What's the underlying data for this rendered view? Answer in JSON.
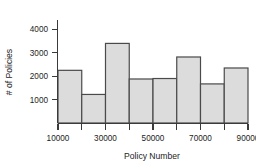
{
  "chart_data": {
    "type": "bar",
    "title": "",
    "subtitle": "",
    "xlabel": "Policy Number",
    "ylabel": "# of Policies",
    "categories": [
      "10000-20000",
      "20000-30000",
      "30000-40000",
      "40000-50000",
      "50000-60000",
      "60000-70000",
      "70000-80000",
      "80000-90000"
    ],
    "bin_edges": [
      10000,
      20000,
      30000,
      40000,
      50000,
      60000,
      70000,
      80000,
      90000
    ],
    "values": [
      2250,
      1220,
      3400,
      1880,
      1900,
      2820,
      1670,
      2350
    ],
    "series": [
      {
        "name": "# of Policies",
        "values": [
          2250,
          1220,
          3400,
          1880,
          1900,
          2820,
          1670,
          2350
        ]
      }
    ],
    "xlim": [
      10000,
      90000
    ],
    "ylim": [
      0,
      4400
    ],
    "x_ticks": [
      10000,
      20000,
      30000,
      40000,
      50000,
      60000,
      70000,
      80000,
      90000
    ],
    "x_tick_labels": [
      "10000",
      "",
      "30000",
      "",
      "50000",
      "",
      "70000",
      "",
      "90000"
    ],
    "y_ticks": [
      1000,
      2000,
      3000,
      4000
    ],
    "y_tick_labels": [
      "1000",
      "2000",
      "3000",
      "4000"
    ],
    "grid": false,
    "legend": false,
    "legend_position": "none",
    "bar_fill_color": "#dcdcdc",
    "bar_edge_color": "#4a4a4a",
    "axis_color": "#3a3a3a",
    "background_color": "#ffffff"
  },
  "labels": {
    "x_axis_title": "Policy Number",
    "y_axis_title": "# of Policies",
    "x_tick_0": "10000",
    "x_tick_1": "30000",
    "x_tick_2": "50000",
    "x_tick_3": "70000",
    "x_tick_4": "90000",
    "y_tick_0": "1000",
    "y_tick_1": "2000",
    "y_tick_2": "3000",
    "y_tick_3": "4000"
  }
}
